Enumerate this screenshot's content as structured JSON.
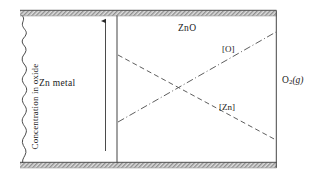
{
  "figure": {
    "title_present": false,
    "regions": {
      "metal_label": "Zn metal",
      "oxide_label": "ZnO",
      "gas_label_text": "O",
      "gas_label_sub": "2",
      "gas_label_state": "(g)"
    },
    "axis": {
      "caption": "Concentration in oxide",
      "direction": "up",
      "arrow_icon": "up-arrow-icon"
    },
    "curves": [
      {
        "name": "oxygen-concentration-line",
        "label": "[O]",
        "style": "dash-dot",
        "trend": "increasing",
        "from": {
          "x": 118,
          "y": 122
        },
        "to": {
          "x": 276,
          "y": 32
        }
      },
      {
        "name": "zinc-concentration-line",
        "label": "[Zn]",
        "style": "dashed",
        "trend": "decreasing",
        "from": {
          "x": 118,
          "y": 55
        },
        "to": {
          "x": 276,
          "y": 140
        }
      }
    ],
    "boundaries": {
      "metal_oxide_interface_x": 117,
      "oxide_gas_interface_x": 276,
      "left_break_edge": "wavy",
      "top_band": "hatched",
      "bottom_band": "hatched"
    },
    "colors": {
      "ink": "#1a1a1a",
      "line": "#333333",
      "hatch_light": "#d8d8d8",
      "hatch_dark": "#8a8a8a",
      "background": "#ffffff"
    }
  }
}
